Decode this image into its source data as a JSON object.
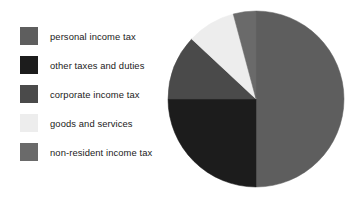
{
  "legend": {
    "items": [
      {
        "label": "personal income tax",
        "color": "#5e5e5e",
        "swatch_name": "legend-swatch-personal-income-tax"
      },
      {
        "label": "other taxes and duties",
        "color": "#1c1c1c",
        "swatch_name": "legend-swatch-other-taxes-and-duties"
      },
      {
        "label": "corporate income tax",
        "color": "#4a4a4a",
        "swatch_name": "legend-swatch-corporate-income-tax"
      },
      {
        "label": "goods and services",
        "color": "#ededed",
        "swatch_name": "legend-swatch-goods-and-services"
      },
      {
        "label": "non-resident income tax",
        "color": "#6a6a6a",
        "swatch_name": "legend-swatch-non-resident-income-tax"
      }
    ]
  },
  "chart_data": {
    "type": "pie",
    "title": "",
    "subtitle": "",
    "xlabel": "",
    "ylabel": "",
    "grid": false,
    "legend_position": "left",
    "start_angle_deg": 0,
    "direction": "clockwise",
    "center": {
      "x": 250,
      "y": 100
    },
    "radius": 88,
    "categories": [
      "personal income tax",
      "other taxes and duties",
      "corporate income tax",
      "goods and services",
      "non-resident income tax"
    ],
    "values": [
      50,
      25,
      12,
      9,
      4
    ],
    "units": "percent",
    "colors": [
      "#5e5e5e",
      "#1c1c1c",
      "#4a4a4a",
      "#ededed",
      "#6a6a6a"
    ],
    "slices": [
      {
        "label": "personal income tax",
        "value": 50,
        "color": "#5e5e5e",
        "start_deg": 0,
        "end_deg": 180
      },
      {
        "label": "other taxes and duties",
        "value": 25,
        "color": "#1c1c1c",
        "start_deg": 180,
        "end_deg": 270
      },
      {
        "label": "corporate income tax",
        "value": 12,
        "color": "#4a4a4a",
        "start_deg": 270,
        "end_deg": 313
      },
      {
        "label": "goods and services",
        "value": 9,
        "color": "#ededed",
        "start_deg": 313,
        "end_deg": 345
      },
      {
        "label": "non-resident income tax",
        "value": 4,
        "color": "#6a6a6a",
        "start_deg": 345,
        "end_deg": 360
      }
    ]
  }
}
